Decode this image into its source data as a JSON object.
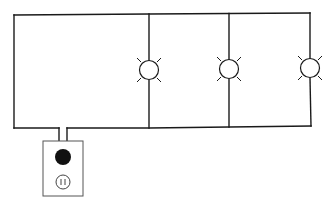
{
  "diagram": {
    "title": "",
    "type": "parallel-circuit",
    "components": [
      {
        "id": "bulb-1",
        "kind": "light-bulb",
        "icon": "light-bulb-icon"
      },
      {
        "id": "bulb-2",
        "kind": "light-bulb",
        "icon": "light-bulb-icon"
      },
      {
        "id": "bulb-3",
        "kind": "light-bulb",
        "icon": "light-bulb-icon"
      },
      {
        "id": "plug",
        "kind": "plug",
        "icon": "plug-icon"
      },
      {
        "id": "outlet",
        "kind": "wall-outlet",
        "icon": "outlet-icon"
      }
    ],
    "colors": {
      "wire": "#1a1a1a",
      "background": "#ffffff",
      "plug": "#111111"
    }
  }
}
